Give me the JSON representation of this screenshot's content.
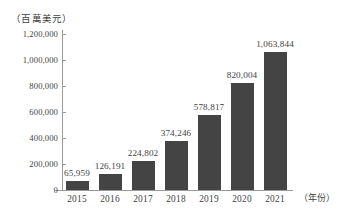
{
  "chart_data": {
    "type": "bar",
    "title": "",
    "subtitle": "",
    "xlabel": "（年份）",
    "ylabel": "（百萬美元）",
    "categories": [
      "2015",
      "2016",
      "2017",
      "2018",
      "2019",
      "2020",
      "2021"
    ],
    "values": [
      65959,
      126191,
      224802,
      374246,
      578817,
      820004,
      1063844
    ],
    "value_labels": [
      "65,959",
      "126,191",
      "224,802",
      "374,246",
      "578,817",
      "820,004",
      "1,063,844"
    ],
    "series": [
      {
        "name": "",
        "values": [
          65959,
          126191,
          224802,
          374246,
          578817,
          820004,
          1063844
        ]
      }
    ],
    "ylim": [
      0,
      1200000
    ],
    "ytick_values": [
      1200000,
      1000000,
      800000,
      600000,
      400000,
      200000,
      0
    ],
    "ytick_labels": [
      "1,200,000",
      "1,000,000",
      "800,000",
      "600,000",
      "400,000",
      "200,000",
      "0"
    ],
    "grid": false,
    "legend": false,
    "legend_position": "none",
    "bar_color": "#444444",
    "axis_color": "#9a9a9a",
    "text_color": "#3f3f3f",
    "background_color": "#ffffff",
    "data_labels_shown": true
  }
}
